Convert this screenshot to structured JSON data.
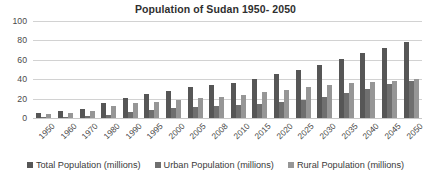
{
  "chart_data": {
    "type": "bar",
    "title": "Population of Sudan 1950- 2050",
    "xlabel": "",
    "ylabel": "",
    "ylim": [
      0,
      100
    ],
    "yticks": [
      0,
      20,
      40,
      60,
      80,
      100
    ],
    "grid": true,
    "legend_position": "bottom",
    "categories": [
      "1950",
      "1960",
      "1970",
      "1980",
      "1990",
      "1995",
      "2000",
      "2005",
      "2008",
      "2010",
      "2015",
      "2020",
      "2025",
      "2030",
      "2035",
      "2040",
      "2045",
      "2050"
    ],
    "series": [
      {
        "name": "Total Population (millions)",
        "color": "#565656",
        "values": [
          5,
          7,
          9,
          15,
          21,
          25,
          28,
          32,
          34,
          36,
          40,
          45,
          50,
          55,
          61,
          67,
          72,
          78
        ]
      },
      {
        "name": "Urban Population (millions)",
        "color": "#6f6f6f",
        "values": [
          1,
          1,
          2,
          3,
          6,
          8,
          10,
          11,
          12,
          13,
          14,
          16,
          19,
          22,
          26,
          30,
          35,
          38
        ]
      },
      {
        "name": "Rural Population (millions)",
        "color": "#969696",
        "values": [
          4,
          5,
          7,
          12,
          15,
          17,
          19,
          21,
          22,
          24,
          27,
          29,
          32,
          34,
          36,
          37,
          38,
          40
        ]
      }
    ]
  }
}
